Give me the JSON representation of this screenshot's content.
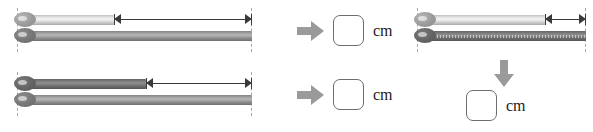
{
  "worksheet": {
    "unit_label": "cm",
    "panels": [
      {
        "id": "panel-top-left",
        "name": "length-difference-problem-1",
        "top_rod": {
          "shade": "light",
          "length_label": ""
        },
        "bottom_rod": {
          "shade": "dark",
          "length_label": ""
        },
        "measure": {
          "name": "difference-arrow",
          "label": ""
        },
        "flow_arrow": "arrow-right-icon",
        "answer": {
          "value": "",
          "unit": "cm"
        }
      },
      {
        "id": "panel-bottom-left",
        "name": "length-difference-problem-2",
        "top_rod": {
          "shade": "darker",
          "length_label": ""
        },
        "bottom_rod": {
          "shade": "dark",
          "length_label": ""
        },
        "measure": {
          "name": "difference-arrow",
          "label": ""
        },
        "flow_arrow": "arrow-right-icon",
        "answer": {
          "value": "",
          "unit": "cm"
        }
      },
      {
        "id": "panel-right",
        "name": "length-difference-problem-3",
        "top_rod": {
          "shade": "light",
          "length_label": ""
        },
        "bottom_rod": {
          "shade": "darker",
          "length_label": ""
        },
        "measure": {
          "name": "difference-arrow",
          "label": ""
        },
        "flow_arrow": "arrow-down-icon",
        "answer": {
          "value": "",
          "unit": "cm"
        }
      }
    ],
    "colors": {
      "rod_light": "#e8e8e8",
      "rod_dark": "#a9a9a9",
      "rod_darker": "#838383",
      "arrow_fill": "#9a9a9a",
      "measure_line": "#3a3a3a",
      "guide_line": "#c49a9a",
      "box_border": "#6d6d6d"
    }
  }
}
